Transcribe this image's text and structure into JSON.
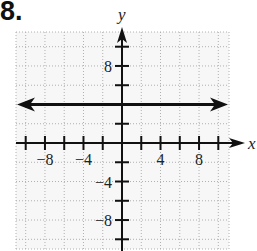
{
  "problem": {
    "number": "8."
  },
  "chart_data": {
    "type": "line",
    "title": "",
    "xlabel": "x",
    "ylabel": "y",
    "xlim": [
      -11,
      11
    ],
    "ylim": [
      -11,
      11
    ],
    "grid": true,
    "grid_style": "dotted",
    "grid_step": 2,
    "x_ticks": [
      -10,
      -8,
      -6,
      -4,
      -2,
      0,
      2,
      4,
      6,
      8,
      10
    ],
    "y_ticks": [
      -10,
      -8,
      -6,
      -4,
      -2,
      0,
      2,
      4,
      6,
      8,
      10
    ],
    "x_tick_labels": {
      "-8": "−8",
      "-4": "−4",
      "4": "4",
      "8": "8"
    },
    "y_tick_labels": {
      "8": "8",
      "-4": "−4",
      "-8": "−8"
    },
    "series": [
      {
        "name": "y = 4",
        "equation": "y = 4",
        "x": [
          -11,
          11
        ],
        "values": [
          4,
          4
        ],
        "arrows": "both"
      }
    ],
    "colors": {
      "line": "#111111",
      "axis": "#111111",
      "grid": "#b0b0b0",
      "background": "#f7f7f7"
    }
  }
}
